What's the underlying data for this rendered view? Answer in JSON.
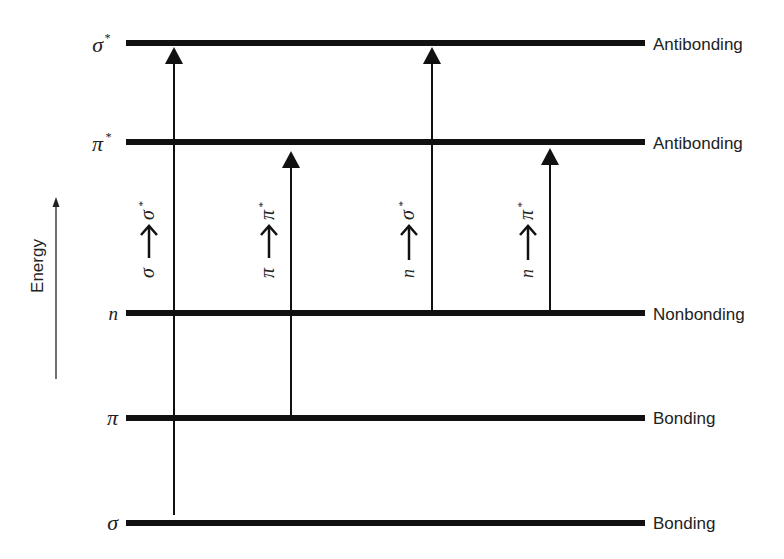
{
  "axis": {
    "label": "Energy",
    "direction": "up"
  },
  "levels": [
    {
      "id": "sigma_star",
      "symbol": "σ",
      "superscript": "*",
      "type": "Antibonding",
      "y": 43
    },
    {
      "id": "pi_star",
      "symbol": "π",
      "superscript": "*",
      "type": "Antibonding",
      "y": 142
    },
    {
      "id": "n",
      "symbol": "n",
      "superscript": "",
      "type": "Nonbonding",
      "y": 313
    },
    {
      "id": "pi",
      "symbol": "π",
      "superscript": "",
      "type": "Bonding",
      "y": 418
    },
    {
      "id": "sigma",
      "symbol": "σ",
      "superscript": "",
      "type": "Bonding",
      "y": 523
    }
  ],
  "transitions": [
    {
      "id": "sigma_to_sigma_star",
      "from": "σ",
      "to": "σ",
      "to_sup": "*",
      "label": "σ → σ*",
      "x": 174
    },
    {
      "id": "pi_to_pi_star",
      "from": "π",
      "to": "π",
      "to_sup": "*",
      "label": "π → π*",
      "x": 291
    },
    {
      "id": "n_to_sigma_star",
      "from": "n",
      "to": "σ",
      "to_sup": "*",
      "label": "n → σ*",
      "x": 432
    },
    {
      "id": "n_to_pi_star",
      "from": "n",
      "to": "π",
      "to_sup": "*",
      "label": "n → π*",
      "x": 550
    }
  ],
  "colors": {
    "ink": "#111111",
    "background": "#ffffff"
  }
}
